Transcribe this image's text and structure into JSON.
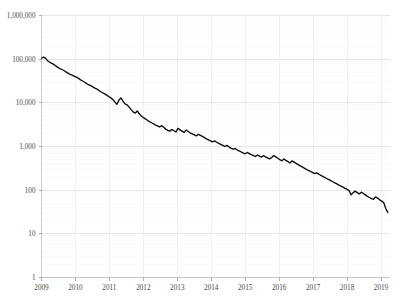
{
  "chart_data": {
    "type": "line",
    "title": "",
    "subtitle": "",
    "xlabel": "",
    "ylabel": "",
    "yscale": "log",
    "xscale": "linear",
    "grid": true,
    "legend": false,
    "legend_position": "none",
    "xlim": [
      2009.0,
      2019.25
    ],
    "ylim": [
      1,
      1000000
    ],
    "ytick_labels": [
      "1,000,000",
      "100,000",
      "10,000",
      "1,000",
      "100",
      "10",
      "1"
    ],
    "ytick_values": [
      1000000,
      100000,
      10000,
      1000,
      100,
      10,
      1
    ],
    "xtick_labels": [
      "2009",
      "2010",
      "2011",
      "2012",
      "2013",
      "2014",
      "2015",
      "2016",
      "2017",
      "2018",
      "2019"
    ],
    "xtick_values": [
      2009,
      2010,
      2011,
      2012,
      2013,
      2014,
      2015,
      2016,
      2017,
      2018,
      2019
    ],
    "series": [
      {
        "name": "value",
        "color": "#0d0d0d",
        "x": [
          2009.0,
          2009.06,
          2009.12,
          2009.18,
          2009.24,
          2009.3,
          2009.36,
          2009.42,
          2009.48,
          2009.54,
          2009.6,
          2009.66,
          2009.72,
          2009.78,
          2009.84,
          2009.9,
          2009.96,
          2010.02,
          2010.08,
          2010.14,
          2010.2,
          2010.26,
          2010.32,
          2010.38,
          2010.44,
          2010.5,
          2010.56,
          2010.62,
          2010.68,
          2010.74,
          2010.8,
          2010.86,
          2010.92,
          2010.98,
          2011.04,
          2011.1,
          2011.16,
          2011.22,
          2011.28,
          2011.34,
          2011.4,
          2011.46,
          2011.52,
          2011.58,
          2011.64,
          2011.7,
          2011.76,
          2011.82,
          2011.88,
          2011.94,
          2012.0,
          2012.06,
          2012.12,
          2012.18,
          2012.24,
          2012.3,
          2012.36,
          2012.42,
          2012.48,
          2012.54,
          2012.6,
          2012.66,
          2012.72,
          2012.78,
          2012.84,
          2012.9,
          2012.96,
          2013.02,
          2013.08,
          2013.14,
          2013.2,
          2013.26,
          2013.32,
          2013.38,
          2013.44,
          2013.5,
          2013.56,
          2013.62,
          2013.68,
          2013.74,
          2013.8,
          2013.86,
          2013.92,
          2013.98,
          2014.04,
          2014.1,
          2014.16,
          2014.22,
          2014.28,
          2014.34,
          2014.4,
          2014.46,
          2014.52,
          2014.58,
          2014.64,
          2014.7,
          2014.76,
          2014.82,
          2014.88,
          2014.94,
          2015.0,
          2015.06,
          2015.12,
          2015.18,
          2015.24,
          2015.3,
          2015.36,
          2015.42,
          2015.48,
          2015.54,
          2015.6,
          2015.66,
          2015.72,
          2015.78,
          2015.84,
          2015.9,
          2015.96,
          2016.02,
          2016.08,
          2016.14,
          2016.2,
          2016.26,
          2016.32,
          2016.38,
          2016.44,
          2016.5,
          2016.56,
          2016.62,
          2016.68,
          2016.74,
          2016.8,
          2016.86,
          2016.92,
          2016.98,
          2017.04,
          2017.1,
          2017.16,
          2017.22,
          2017.28,
          2017.34,
          2017.4,
          2017.46,
          2017.52,
          2017.58,
          2017.64,
          2017.7,
          2017.76,
          2017.82,
          2017.88,
          2017.94,
          2018.0,
          2018.06,
          2018.12,
          2018.18,
          2018.24,
          2018.3,
          2018.36,
          2018.42,
          2018.48,
          2018.54,
          2018.6,
          2018.66,
          2018.72,
          2018.78,
          2018.84,
          2018.9,
          2018.96,
          2019.02,
          2019.08,
          2019.14,
          2019.2
        ],
        "y": [
          105000,
          112000,
          104000,
          92000,
          85000,
          80000,
          76000,
          70000,
          65000,
          61000,
          58000,
          55000,
          51000,
          48000,
          45000,
          43000,
          41000,
          39000,
          37000,
          34000,
          32000,
          30000,
          28000,
          26000,
          25000,
          23500,
          22000,
          21000,
          19500,
          18000,
          17000,
          16000,
          15000,
          14000,
          13000,
          12000,
          10500,
          9200,
          11500,
          13000,
          11000,
          9500,
          9000,
          8000,
          7000,
          6200,
          5800,
          6500,
          5600,
          5000,
          4600,
          4300,
          4000,
          3700,
          3500,
          3300,
          3100,
          2950,
          2800,
          3000,
          2750,
          2500,
          2350,
          2250,
          2450,
          2300,
          2150,
          2600,
          2400,
          2250,
          2100,
          2400,
          2200,
          2050,
          1950,
          1850,
          1750,
          1900,
          1800,
          1700,
          1600,
          1500,
          1420,
          1350,
          1280,
          1350,
          1250,
          1180,
          1120,
          1060,
          1000,
          1060,
          980,
          920,
          870,
          900,
          840,
          790,
          750,
          710,
          680,
          730,
          690,
          650,
          620,
          590,
          640,
          600,
          570,
          620,
          580,
          550,
          520,
          560,
          620,
          580,
          540,
          500,
          470,
          520,
          480,
          450,
          420,
          470,
          440,
          410,
          385,
          360,
          340,
          320,
          300,
          285,
          270,
          255,
          240,
          250,
          235,
          220,
          208,
          196,
          185,
          175,
          165,
          156,
          147,
          139,
          131,
          124,
          117,
          110,
          104,
          98,
          78,
          88,
          95,
          88,
          82,
          90,
          84,
          78,
          72,
          68,
          64,
          62,
          70,
          66,
          60,
          56,
          52,
          38,
          31
        ]
      }
    ]
  },
  "axes": {
    "y_label_text": "",
    "x_label_text": ""
  }
}
